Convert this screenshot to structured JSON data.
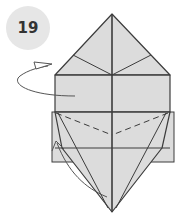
{
  "step": {
    "number": "19"
  },
  "diagram": {
    "paper_color": "#dcdcdc",
    "line_color": "#3c3c3c",
    "arrow_color": "#555555",
    "badge_color": "#e6e6e6",
    "elements": [
      {
        "kind": "model",
        "description": "diamond-shaped folded model with horizontal band"
      },
      {
        "kind": "crease",
        "style": "valley-fold-dashed",
        "description": "dashed V-shaped lines in lower half"
      },
      {
        "kind": "arrow",
        "style": "turn-over",
        "description": "curved arrow on left indicating turn model over"
      },
      {
        "kind": "arrow",
        "style": "fold",
        "description": "curved arrow from bottom point up-left"
      }
    ]
  }
}
